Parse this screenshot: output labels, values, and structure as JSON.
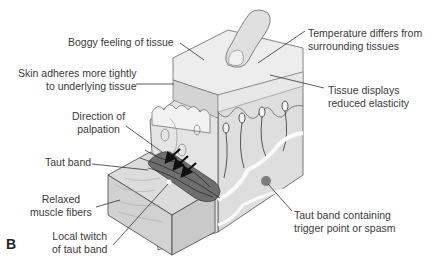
{
  "figure": {
    "panel_letter": "B",
    "labels": {
      "boggy": "Boggy feeling of tissue",
      "skin_adheres_1": "Skin adheres more tightly",
      "skin_adheres_2": "to underlying tissue",
      "direction_1": "Direction of",
      "direction_2": "palpation",
      "taut_band": "Taut band",
      "relaxed_1": "Relaxed",
      "relaxed_2": "muscle fibers",
      "twitch_1": "Local twitch",
      "twitch_2": "of taut band",
      "temperature_1": "Temperature differs from",
      "temperature_2": "surrounding tissues",
      "elasticity_1": "Tissue displays",
      "elasticity_2": "reduced elasticity",
      "trigger_1": "Taut band containing",
      "trigger_2": "trigger point or spasm"
    },
    "colors": {
      "tissue_fill": "#e6e6e6",
      "skin_top": "#ececec",
      "taut_band": "#6e6e6e",
      "line": "#333333",
      "text": "#3a3a3a"
    }
  }
}
